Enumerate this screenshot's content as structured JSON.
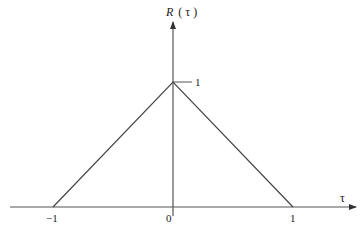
{
  "diagram": {
    "y_axis": {
      "label": "R ( τ )",
      "label_var": "R",
      "label_arg": "( τ )"
    },
    "x_axis": {
      "label": "τ"
    },
    "ticks_x": [
      {
        "value": -1,
        "label": "−1"
      },
      {
        "value": 0,
        "label": "0"
      },
      {
        "value": 1,
        "label": "1"
      }
    ],
    "ticks_y": [
      {
        "value": 1,
        "label": "1"
      }
    ],
    "curve": {
      "type": "triangle",
      "points": [
        [
          -1,
          0
        ],
        [
          0,
          1
        ],
        [
          1,
          0
        ]
      ]
    },
    "colors": {
      "line": "#444444",
      "axis": "#555555",
      "text": "#222222",
      "background": "#ffffff"
    }
  }
}
